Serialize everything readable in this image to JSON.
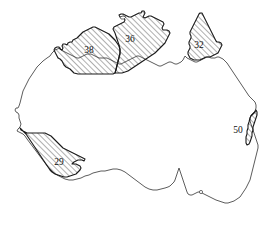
{
  "figure": {
    "background_color": "#ffffff",
    "outline_color": "#4a4a4a",
    "region_outline_color": "#1a1a1a",
    "hatch_color": "#2b2b2b",
    "label_color": "#111111",
    "width": 276,
    "height": 225
  },
  "regions": [
    {
      "id": "region-38",
      "label": "38",
      "label_x": 89,
      "label_y": 51,
      "hatched": true,
      "position": "north-west"
    },
    {
      "id": "region-36",
      "label": "36",
      "label_x": 130,
      "label_y": 40,
      "hatched": true,
      "position": "north-central"
    },
    {
      "id": "region-32",
      "label": "32",
      "label_x": 199,
      "label_y": 46,
      "hatched": true,
      "position": "north-east"
    },
    {
      "id": "region-50",
      "label": "50",
      "label_x": 238,
      "label_y": 131,
      "hatched": true,
      "position": "east-coast"
    },
    {
      "id": "region-29",
      "label": "29",
      "label_x": 59,
      "label_y": 163,
      "hatched": true,
      "position": "south-west"
    }
  ]
}
